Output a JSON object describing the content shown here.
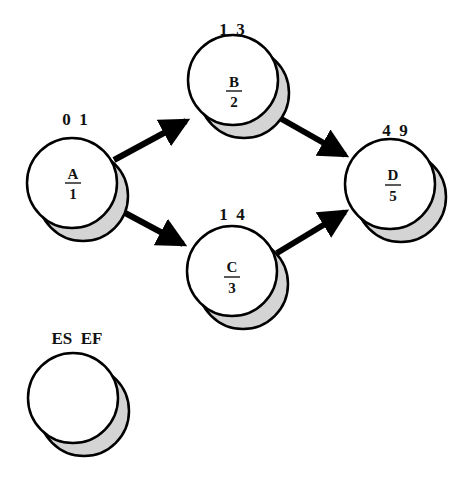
{
  "diagram": {
    "type": "activity-on-node network",
    "colors": {
      "stroke": "#000000",
      "fill": "#ffffff",
      "shadow": "#d4d4d4"
    },
    "nodes": [
      {
        "id": "A",
        "name": "A",
        "duration": "1",
        "es_ef": "0 1",
        "cx": 72,
        "cy": 183
      },
      {
        "id": "B",
        "name": "B",
        "duration": "2",
        "es_ef": "1 3",
        "cx": 233,
        "cy": 80
      },
      {
        "id": "C",
        "name": "C",
        "duration": "3",
        "es_ef": "1 4",
        "cx": 232,
        "cy": 271
      },
      {
        "id": "D",
        "name": "D",
        "duration": "5",
        "es_ef": "4 9",
        "cx": 390,
        "cy": 184
      }
    ],
    "edges": [
      {
        "from": "A",
        "to": "B"
      },
      {
        "from": "A",
        "to": "C"
      },
      {
        "from": "B",
        "to": "D"
      },
      {
        "from": "C",
        "to": "D"
      }
    ],
    "legend": {
      "label": "ES EF",
      "cx": 73,
      "cy": 398
    }
  }
}
